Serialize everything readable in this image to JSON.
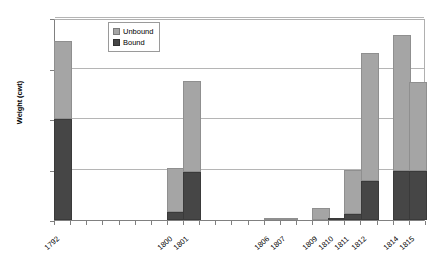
{
  "chart_data": {
    "type": "bar",
    "title": "",
    "subtitle": "",
    "xlabel": "",
    "ylabel": "Weight (cwt)",
    "ylim": [
      0,
      2000
    ],
    "yticks": [
      0,
      500,
      1000,
      1500,
      2000
    ],
    "ytick_labels": [
      "0",
      "500",
      "1000",
      "1500",
      "2000"
    ],
    "grid": true,
    "stacked": true,
    "legend_position": "top-left-inside",
    "categories": [
      "1792",
      "",
      "",
      "",
      "",
      "",
      "",
      "1800",
      "1801",
      "",
      "",
      "",
      "",
      "1806",
      "1807",
      "",
      "1809",
      "1810",
      "1811",
      "1812",
      "",
      "1814",
      "1815"
    ],
    "series": [
      {
        "name": "Bound",
        "color": "#464646",
        "values": [
          1000,
          0,
          0,
          0,
          0,
          0,
          0,
          75,
          480,
          0,
          0,
          0,
          0,
          0,
          0,
          0,
          0,
          10,
          55,
          390,
          0,
          490,
          490
        ]
      },
      {
        "name": "Unbound",
        "color": "#a5a5a5",
        "values": [
          770,
          0,
          0,
          0,
          0,
          0,
          0,
          440,
          900,
          0,
          0,
          0,
          0,
          20,
          5,
          0,
          120,
          0,
          445,
          1260,
          0,
          1340,
          880
        ]
      }
    ],
    "totals": [
      1770,
      0,
      0,
      0,
      0,
      0,
      0,
      515,
      1380,
      0,
      0,
      0,
      0,
      20,
      5,
      0,
      120,
      10,
      500,
      1650,
      0,
      1830,
      1370
    ]
  },
  "legend": {
    "items": [
      {
        "label": "Unbound",
        "swatch": "unbound"
      },
      {
        "label": "Bound",
        "swatch": "bound"
      }
    ]
  },
  "colors": {
    "unbound": "#a5a5a5",
    "bound": "#464646",
    "gridline": "#b5b5b5",
    "axis": "#808080",
    "background": "#ffffff"
  }
}
